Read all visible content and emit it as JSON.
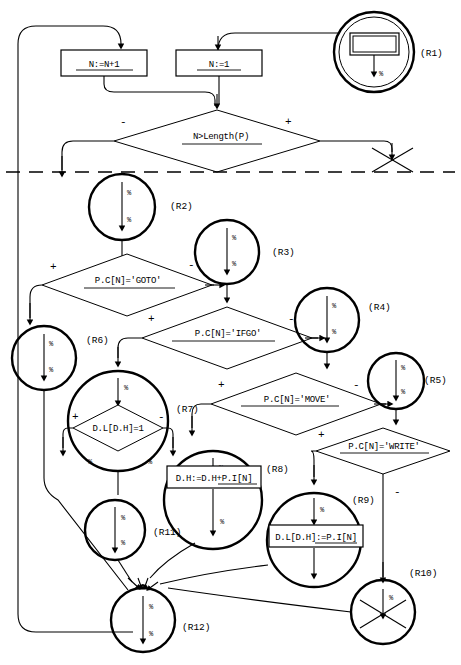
{
  "diagram": {
    "percent_symbol": "%",
    "signs": {
      "plus": "+",
      "minus": "-"
    },
    "processes": [
      {
        "id": "inc-n",
        "text": "N:=N+1"
      },
      {
        "id": "set-n1",
        "text": "N:=1"
      },
      {
        "id": "dh-add",
        "text": "D.H:=D.H+P.I[N]"
      },
      {
        "id": "dl-set",
        "text": "D.L[D.H]:=P.I[N]"
      }
    ],
    "decisions": [
      {
        "id": "len-test",
        "text": "N>Length(P)"
      },
      {
        "id": "cmd-goto",
        "text": "P.C[N]='GOTO'"
      },
      {
        "id": "cmd-ifgo",
        "text": "P.C[N]='IFGO'"
      },
      {
        "id": "cmd-move",
        "text": "P.C[N]='MOVE'"
      },
      {
        "id": "cmd-write",
        "text": "P.C[N]='WRITE'"
      },
      {
        "id": "dl-test",
        "text": "D.L[D.H]=1"
      }
    ],
    "regions": [
      {
        "id": "r1",
        "label": "(R1)"
      },
      {
        "id": "r2",
        "label": "(R2)"
      },
      {
        "id": "r3",
        "label": "(R3)"
      },
      {
        "id": "r4",
        "label": "(R4)"
      },
      {
        "id": "r5",
        "label": "(R5)"
      },
      {
        "id": "r6",
        "label": "(R6)"
      },
      {
        "id": "r7",
        "label": "(R7)"
      },
      {
        "id": "r8",
        "label": "(R8)"
      },
      {
        "id": "r9",
        "label": "(R9)"
      },
      {
        "id": "r10",
        "label": "(R10)"
      },
      {
        "id": "r11",
        "label": "(R11)"
      },
      {
        "id": "r12",
        "label": "(R12)"
      }
    ]
  }
}
